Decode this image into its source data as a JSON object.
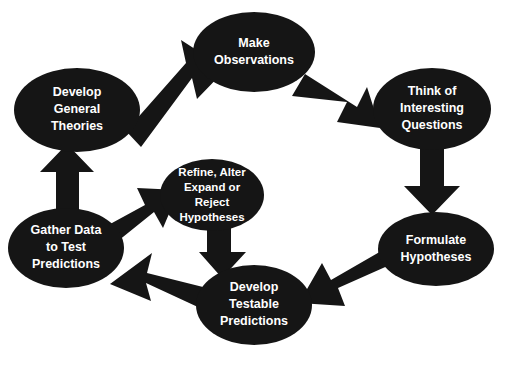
{
  "diagram": {
    "type": "cycle-flowchart",
    "background_color": "#ffffff",
    "node_color": "#151515",
    "node_text_color": "#ffffff",
    "arrow_color": "#151515",
    "nodes": [
      {
        "id": "develop-general-theories",
        "lines": [
          "Develop",
          "General",
          "Theories"
        ],
        "cx": 77,
        "cy": 110,
        "rx": 63,
        "ry": 42,
        "font_size": 12.5,
        "line_height": 17
      },
      {
        "id": "make-observations",
        "lines": [
          "Make",
          "Observations"
        ],
        "cx": 254,
        "cy": 52,
        "rx": 61,
        "ry": 40,
        "font_size": 12.5,
        "line_height": 17
      },
      {
        "id": "think-of-interesting-questions",
        "lines": [
          "Think of",
          "Interesting",
          "Questions"
        ],
        "cx": 432,
        "cy": 109,
        "rx": 59,
        "ry": 41,
        "font_size": 12.5,
        "line_height": 17
      },
      {
        "id": "formulate-hypotheses",
        "lines": [
          "Formulate",
          "Hypotheses"
        ],
        "cx": 436,
        "cy": 249,
        "rx": 58,
        "ry": 37,
        "font_size": 12.5,
        "line_height": 17
      },
      {
        "id": "develop-testable-predictions",
        "lines": [
          "Develop",
          "Testable",
          "Predictions"
        ],
        "cx": 254,
        "cy": 305,
        "rx": 58,
        "ry": 40,
        "font_size": 12.5,
        "line_height": 17
      },
      {
        "id": "gather-data-to-test-predictions",
        "lines": [
          "Gather Data",
          "to Test",
          "Predictions"
        ],
        "cx": 66,
        "cy": 248,
        "rx": 58,
        "ry": 40,
        "font_size": 12.5,
        "line_height": 17
      },
      {
        "id": "refine-alter-expand-or-reject-hypotheses",
        "lines": [
          "Refine, Alter",
          "Expand or",
          "Reject",
          "Hypotheses"
        ],
        "cx": 212,
        "cy": 195,
        "rx": 52,
        "ry": 36,
        "font_size": 11.5,
        "line_height": 15
      }
    ],
    "arrows": [
      {
        "id": "theories-to-observations",
        "from": "develop-general-theories",
        "to": "make-observations",
        "direction": "up-right",
        "points": "126,131 186,63 181,40 226,69 197,99 192,78 141,147"
      },
      {
        "id": "observations-to-questions",
        "from": "make-observations",
        "to": "think-of-interesting-questions",
        "direction": "down-right",
        "points": "305,74 357,107 367,87 380,128 337,122 347,102 292,96"
      },
      {
        "id": "questions-to-hypotheses",
        "from": "think-of-interesting-questions",
        "to": "formulate-hypotheses",
        "direction": "down",
        "points": "420,140 444,140 444,186 460,186 432,215 404,186 420,186"
      },
      {
        "id": "hypotheses-to-predictions",
        "from": "formulate-hypotheses",
        "to": "develop-testable-predictions",
        "direction": "down-left",
        "points": "392,264 338,288 345,306 299,303 322,263 331,280 383,250"
      },
      {
        "id": "predictions-to-gather-data",
        "from": "develop-testable-predictions",
        "to": "gather-data-to-test-predictions",
        "direction": "up-left",
        "points": "203,287 147,273 152,253 110,284 151,301 146,283 200,308"
      },
      {
        "id": "gather-data-to-theories",
        "from": "gather-data-to-test-predictions",
        "to": "develop-general-theories",
        "direction": "up",
        "points": "56,218 79,218 79,172 94,172 67,144 40,172 56,172"
      },
      {
        "id": "gather-data-to-refine",
        "from": "gather-data-to-test-predictions",
        "to": "refine-alter-expand-or-reject-hypotheses",
        "direction": "up-right",
        "points": "101,229 145,205 137,188 179,190 163,228 154,212 113,245"
      },
      {
        "id": "refine-to-predictions",
        "from": "refine-alter-expand-or-reject-hypotheses",
        "to": "develop-testable-predictions",
        "direction": "down",
        "points": "207,222 231,222 231,252 246,252 222,278 199,252 207,252"
      }
    ]
  }
}
